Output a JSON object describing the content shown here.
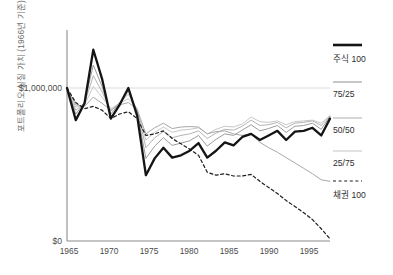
{
  "chart_data": {
    "type": "line",
    "title": "",
    "xlabel": "",
    "ylabel": "포트폴리오 실질 가치 (1966년 기준)",
    "x": [
      1965,
      1966,
      1967,
      1968,
      1969,
      1970,
      1971,
      1972,
      1973,
      1974,
      1975,
      1976,
      1977,
      1978,
      1979,
      1980,
      1981,
      1982,
      1983,
      1984,
      1985,
      1986,
      1987,
      1988,
      1989,
      1990,
      1991,
      1992,
      1993,
      1994,
      1995
    ],
    "xlim": [
      1965,
      1995
    ],
    "ylim": [
      0,
      1450000
    ],
    "yticks": [
      0,
      1000000
    ],
    "ytick_labels": [
      "$0",
      "$1,000,000"
    ],
    "xticks": [
      1965,
      1970,
      1975,
      1980,
      1985,
      1990,
      1995
    ],
    "xtick_labels": [
      "1965",
      "1970",
      "1975",
      "1980",
      "1985",
      "1990",
      "1995"
    ],
    "gridlines": "horizontal-at-1000000",
    "legend_position": "right",
    "series": [
      {
        "name": "주식 100",
        "style": "solid",
        "color": "#141414",
        "width": 2.3,
        "values": [
          1000000,
          790000,
          900000,
          1250000,
          1060000,
          800000,
          890000,
          1000000,
          820000,
          430000,
          540000,
          610000,
          545000,
          560000,
          590000,
          640000,
          545000,
          590000,
          645000,
          625000,
          680000,
          700000,
          660000,
          690000,
          720000,
          660000,
          715000,
          720000,
          740000,
          690000,
          800000
        ]
      },
      {
        "name": "75/25",
        "style": "solid",
        "color": "#9c9c9c",
        "width": 1.0,
        "values": [
          1000000,
          830000,
          905000,
          1150000,
          1010000,
          830000,
          900000,
          980000,
          845000,
          540000,
          620000,
          675000,
          625000,
          640000,
          655000,
          690000,
          620000,
          665000,
          700000,
          690000,
          725000,
          760000,
          720000,
          735000,
          755000,
          710000,
          750000,
          755000,
          770000,
          730000,
          815000
        ]
      },
      {
        "name": "50/50",
        "style": "solid",
        "color": "#b4b4b4",
        "width": 1.0,
        "values": [
          1000000,
          855000,
          900000,
          1080000,
          975000,
          850000,
          905000,
          960000,
          860000,
          610000,
          675000,
          715000,
          675000,
          690000,
          700000,
          720000,
          670000,
          705000,
          730000,
          725000,
          750000,
          790000,
          755000,
          760000,
          775000,
          740000,
          770000,
          775000,
          785000,
          755000,
          815000
        ]
      },
      {
        "name": "25/75",
        "style": "solid",
        "color": "#c8c8c8",
        "width": 1.0,
        "values": [
          1000000,
          875000,
          890000,
          1010000,
          940000,
          865000,
          900000,
          930000,
          865000,
          660000,
          710000,
          745000,
          710000,
          725000,
          730000,
          740000,
          700000,
          730000,
          750000,
          745000,
          765000,
          810000,
          780000,
          775000,
          785000,
          760000,
          780000,
          785000,
          790000,
          770000,
          820000
        ]
      },
      {
        "name": "채권 100",
        "style": "dashed",
        "color": "#1e1e1e",
        "width": 1.2,
        "values": [
          1000000,
          905000,
          865000,
          880000,
          855000,
          800000,
          830000,
          845000,
          800000,
          690000,
          700000,
          720000,
          670000,
          635000,
          600000,
          560000,
          450000,
          430000,
          440000,
          425000,
          425000,
          435000,
          390000,
          350000,
          310000,
          265000,
          225000,
          185000,
          140000,
          80000,
          15000
        ]
      },
      {
        "name": "bond-mid-line",
        "style": "solid",
        "color": "#a8a8a8",
        "width": 1.0,
        "values": [
          1000000,
          890000,
          880000,
          940000,
          900000,
          855000,
          890000,
          905000,
          860000,
          700000,
          740000,
          770000,
          735000,
          745000,
          748000,
          745000,
          700000,
          715000,
          720000,
          700000,
          690000,
          700000,
          645000,
          610000,
          580000,
          545000,
          510000,
          475000,
          440000,
          400000,
          390000
        ]
      }
    ]
  },
  "legend": {
    "items": [
      {
        "label": "주식 100",
        "swatch": "thick-black-solid"
      },
      {
        "label": "75/25",
        "swatch": "thin-gray-solid"
      },
      {
        "label": "50/50",
        "swatch": "thin-gray-solid"
      },
      {
        "label": "25/75",
        "swatch": "thin-gray-solid"
      },
      {
        "label": "채권 100",
        "swatch": "dashed-black"
      }
    ]
  },
  "axes": {
    "y_axis_label": "포트폴리오 실질 가치 (1966년 기준)",
    "y_top_label": "$1,000,000",
    "y_zero_label": "$0",
    "x_labels": [
      "1965",
      "1970",
      "1975",
      "1980",
      "1985",
      "1990",
      "1995"
    ]
  },
  "colors": {
    "equity": "#141414",
    "grid": "#d8d8d8",
    "axis": "#8c8c8c",
    "text": "#4a4a4a"
  }
}
